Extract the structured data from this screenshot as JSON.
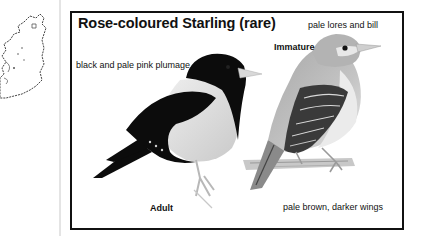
{
  "map": {
    "icon": "ireland-outline-map"
  },
  "plate": {
    "title": "Rose-coloured Starling (rare)",
    "labels": {
      "lores": "pale lores and bill",
      "immature": "Immature",
      "plumage": "black and pale pink plumage",
      "adult": "Adult",
      "wings": "pale brown, darker wings"
    },
    "birds": [
      {
        "name": "adult",
        "icon": "adult-starling-illustration"
      },
      {
        "name": "immature",
        "icon": "immature-starling-illustration"
      }
    ]
  },
  "colors": {
    "frame_border": "#111111",
    "separator": "#e4e4e4",
    "adult_black": "#0c0c0c",
    "adult_pale": "#dedede",
    "immature_body": "#b9b9b9",
    "background": "#ffffff"
  }
}
